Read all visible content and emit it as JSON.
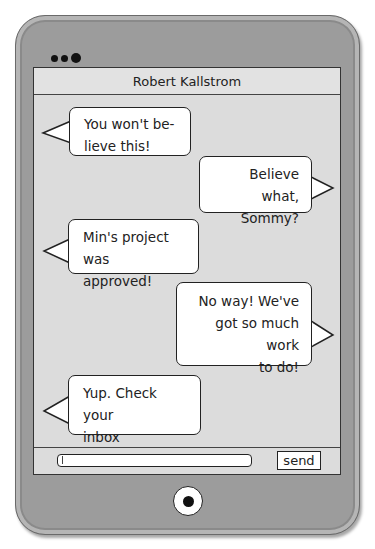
{
  "device": {
    "frame_color": "#9c9c9c",
    "screen_color": "#dcdcdc"
  },
  "header": {
    "contact_name": "Robert Kallstrom"
  },
  "messages": [
    {
      "side": "left",
      "text_lines": [
        "You won't be-",
        "lieve this!"
      ]
    },
    {
      "side": "right",
      "text_lines": [
        "Believe what,",
        "Sommy?"
      ]
    },
    {
      "side": "left",
      "text_lines": [
        "Min's project was",
        "approved!"
      ]
    },
    {
      "side": "right",
      "text_lines": [
        "No way! We've",
        "got so much work",
        "to do!"
      ]
    },
    {
      "side": "left",
      "text_lines": [
        "Yup. Check your",
        "inbox"
      ]
    }
  ],
  "composer": {
    "input_value": "",
    "send_label": "send"
  }
}
